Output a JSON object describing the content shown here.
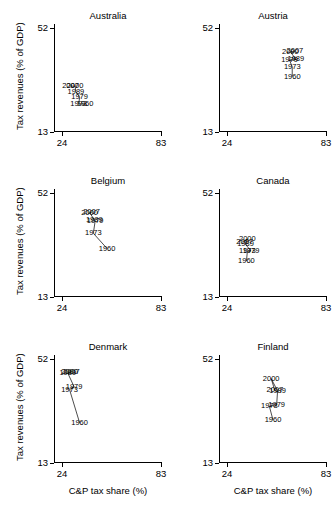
{
  "figure": {
    "xlabel": "C&P tax share (%)",
    "ylabel": "Tax revenues (% of GDP)",
    "xticks": [
      "24",
      "83"
    ],
    "yticks": [
      "52",
      "13"
    ]
  },
  "chart_data": {
    "type": "scatter",
    "title": "",
    "xlabel": "C&P tax share (%)",
    "ylabel": "Tax revenues (% of GDP)",
    "xlim": [
      24,
      83
    ],
    "ylim": [
      13,
      52
    ],
    "grid": false,
    "legend": "none",
    "point_labels_are_years": true,
    "panels": [
      {
        "name": "Australia",
        "row": 0,
        "col": 0,
        "points": [
          {
            "label": "1960",
            "x": 41.0,
            "y": 23.0
          },
          {
            "label": "1973",
            "x": 37.5,
            "y": 23.2
          },
          {
            "label": "1979",
            "x": 38.0,
            "y": 25.5
          },
          {
            "label": "1989",
            "x": 36.0,
            "y": 27.5
          },
          {
            "label": "2000",
            "x": 35.5,
            "y": 29.5
          },
          {
            "label": "2007",
            "x": 33.0,
            "y": 29.6
          }
        ]
      },
      {
        "name": "Austria",
        "row": 0,
        "col": 1,
        "points": [
          {
            "label": "1960",
            "x": 64.0,
            "y": 33.0
          },
          {
            "label": "1973",
            "x": 64.0,
            "y": 36.5
          },
          {
            "label": "1979",
            "x": 62.5,
            "y": 39.0
          },
          {
            "label": "1989",
            "x": 66.0,
            "y": 39.2
          },
          {
            "label": "2000",
            "x": 63.0,
            "y": 42.0
          },
          {
            "label": "2007",
            "x": 65.5,
            "y": 42.2
          }
        ]
      },
      {
        "name": "Belgium",
        "row": 1,
        "col": 0,
        "points": [
          {
            "label": "1960",
            "x": 53.0,
            "y": 30.5
          },
          {
            "label": "1973",
            "x": 45.5,
            "y": 36.0
          },
          {
            "label": "1979",
            "x": 46.5,
            "y": 40.5
          },
          {
            "label": "1989",
            "x": 46.0,
            "y": 40.8
          },
          {
            "label": "2000",
            "x": 43.5,
            "y": 43.5
          },
          {
            "label": "2007",
            "x": 44.5,
            "y": 43.6
          }
        ]
      },
      {
        "name": "Canada",
        "row": 1,
        "col": 1,
        "points": [
          {
            "label": "1960",
            "x": 39.0,
            "y": 26.0
          },
          {
            "label": "1973",
            "x": 39.5,
            "y": 29.5
          },
          {
            "label": "1979",
            "x": 41.5,
            "y": 29.6
          },
          {
            "label": "1989",
            "x": 38.5,
            "y": 32.0
          },
          {
            "label": "2000",
            "x": 39.5,
            "y": 34.0
          },
          {
            "label": "2007",
            "x": 38.0,
            "y": 33.0
          }
        ]
      },
      {
        "name": "Denmark",
        "row": 2,
        "col": 0,
        "points": [
          {
            "label": "1960",
            "x": 38.0,
            "y": 27.5
          },
          {
            "label": "1973",
            "x": 32.5,
            "y": 39.5
          },
          {
            "label": "1979",
            "x": 35.0,
            "y": 40.5
          },
          {
            "label": "1989",
            "x": 31.5,
            "y": 45.5
          },
          {
            "label": "2000",
            "x": 32.5,
            "y": 45.8
          },
          {
            "label": "2007",
            "x": 33.5,
            "y": 46.0
          }
        ]
      },
      {
        "name": "Finland",
        "row": 2,
        "col": 1,
        "points": [
          {
            "label": "1960",
            "x": 53.5,
            "y": 28.5
          },
          {
            "label": "1973",
            "x": 51.5,
            "y": 33.5
          },
          {
            "label": "1979",
            "x": 55.5,
            "y": 34.0
          },
          {
            "label": "1989",
            "x": 56.0,
            "y": 39.0
          },
          {
            "label": "2000",
            "x": 52.5,
            "y": 43.5
          },
          {
            "label": "2007",
            "x": 54.5,
            "y": 39.2
          }
        ]
      }
    ]
  }
}
